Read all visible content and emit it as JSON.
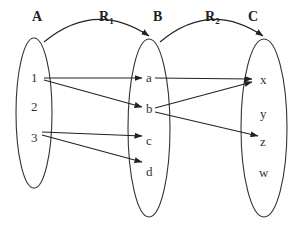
{
  "diagram": {
    "type": "relation-mapping",
    "sets": [
      {
        "id": "A",
        "label": "A",
        "elements": [
          "1",
          "2",
          "3"
        ]
      },
      {
        "id": "B",
        "label": "B",
        "elements": [
          "a",
          "b",
          "c",
          "d"
        ]
      },
      {
        "id": "C",
        "label": "C",
        "elements": [
          "x",
          "y",
          "z",
          "w"
        ]
      }
    ],
    "relations": [
      {
        "id": "R1",
        "label": "R",
        "subscript": "1",
        "from": "A",
        "to": "B",
        "pairs": [
          [
            "1",
            "a"
          ],
          [
            "1",
            "b"
          ],
          [
            "3",
            "c"
          ],
          [
            "3",
            "d"
          ]
        ]
      },
      {
        "id": "R2",
        "label": "R",
        "subscript": "2",
        "from": "B",
        "to": "C",
        "pairs": [
          [
            "a",
            "x"
          ],
          [
            "b",
            "x"
          ],
          [
            "b",
            "z"
          ]
        ]
      }
    ]
  }
}
